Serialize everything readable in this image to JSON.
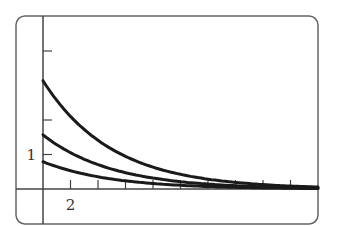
{
  "chart_data": {
    "type": "line",
    "title": "",
    "xlabel": "",
    "ylabel": "",
    "xlim": [
      -2,
      20
    ],
    "ylim": [
      -1,
      5
    ],
    "grid": false,
    "legend": null,
    "x_ticks": [
      2,
      4,
      6,
      8,
      10,
      12,
      14,
      16,
      18
    ],
    "x_tick_labels": [
      {
        "value": 2,
        "label": "2"
      }
    ],
    "y_ticks": [
      1,
      2,
      4
    ],
    "y_tick_labels": [
      {
        "value": 1,
        "label": "1"
      }
    ],
    "x": [
      0,
      2,
      4,
      6,
      8,
      10,
      12,
      14,
      16,
      18,
      20
    ],
    "series": [
      {
        "name": "curve-top",
        "values": [
          3.14,
          2.11,
          1.41,
          0.95,
          0.63,
          0.42,
          0.29,
          0.19,
          0.13,
          0.09,
          0.06
        ]
      },
      {
        "name": "curve-middle",
        "values": [
          1.57,
          1.05,
          0.71,
          0.47,
          0.32,
          0.21,
          0.14,
          0.1,
          0.06,
          0.04,
          0.03
        ]
      },
      {
        "name": "curve-bottom",
        "values": [
          0.79,
          0.53,
          0.35,
          0.24,
          0.16,
          0.11,
          0.07,
          0.05,
          0.03,
          0.02,
          0.01
        ]
      }
    ],
    "colors": {
      "curve": "#1a1a1a",
      "axis": "#444444",
      "frame": "#666666"
    }
  }
}
